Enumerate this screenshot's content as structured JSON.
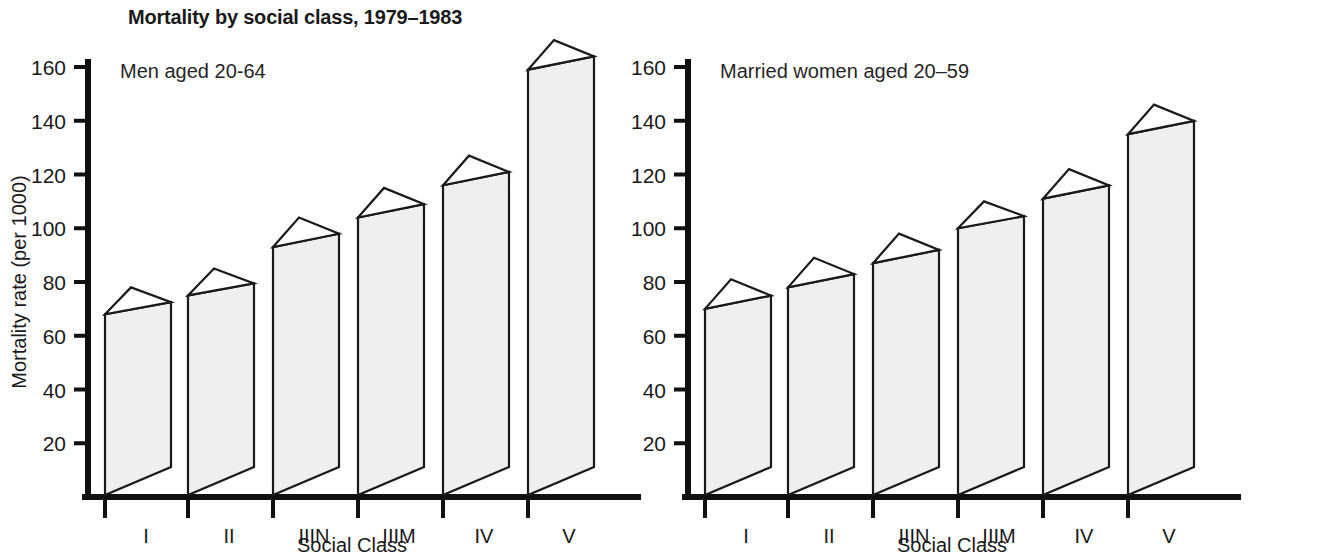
{
  "figure": {
    "title": "Mortality by social class, 1979–1983",
    "y_axis_label": "Mortality rate (per 1000)",
    "x_axis_label": "Social Class"
  },
  "panels": [
    {
      "id": "men",
      "subtitle": "Men aged 20-64"
    },
    {
      "id": "women",
      "subtitle": "Married women aged 20–59"
    }
  ],
  "chart_data": [
    {
      "type": "bar",
      "title": "Mortality by social class, 1979–1983",
      "subtitle": "Men aged 20-64",
      "xlabel": "Social Class",
      "ylabel": "Mortality rate (per 1000)",
      "ylim": [
        0,
        172
      ],
      "yticks": [
        20,
        40,
        60,
        80,
        100,
        120,
        140,
        160
      ],
      "categories": [
        "I",
        "II",
        "IIIN",
        "IIIM",
        "IV",
        "V"
      ],
      "values": [
        68,
        75,
        93,
        104,
        116,
        159
      ],
      "values_back": [
        78,
        85,
        104,
        115,
        127,
        170
      ],
      "grid": false,
      "legend": "none",
      "style": "3d-block"
    },
    {
      "type": "bar",
      "title": "Mortality by social class, 1979–1983",
      "subtitle": "Married women aged 20–59",
      "xlabel": "Social Class",
      "ylabel": "Mortality rate (per 1000)",
      "ylim": [
        0,
        172
      ],
      "yticks": [
        20,
        40,
        60,
        80,
        100,
        120,
        140,
        160
      ],
      "categories": [
        "I",
        "II",
        "IIIN",
        "IIIM",
        "IV",
        "V"
      ],
      "values": [
        70,
        78,
        87,
        100,
        111,
        135
      ],
      "values_back": [
        81,
        89,
        98,
        110,
        122,
        146
      ],
      "grid": false,
      "legend": "none",
      "style": "3d-block"
    }
  ],
  "axis": {
    "ytick_labels": [
      "160",
      "140",
      "120",
      "100",
      "80",
      "60",
      "40",
      "20"
    ],
    "category_labels": [
      "I",
      "II",
      "IIIN",
      "IIIM",
      "IV",
      "V"
    ]
  }
}
